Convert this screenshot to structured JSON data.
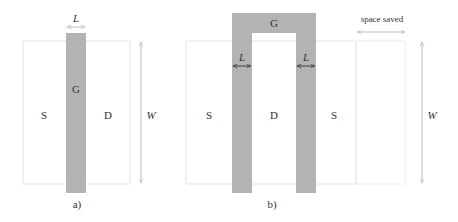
{
  "colors": {
    "gate": "#b3b3b3",
    "outline": "#e2e2e2",
    "arrow_light": "#bdbdbd",
    "arrow_dark": "#444444",
    "text": "#333333"
  },
  "panel_a": {
    "caption": "a)",
    "source_label": "S",
    "drain_label": "D",
    "gate_label": "G",
    "length_label": "L",
    "width_label": "W"
  },
  "panel_b": {
    "caption": "b)",
    "source_left_label": "S",
    "drain_label": "D",
    "source_right_label": "S",
    "gate_label": "G",
    "length_left_label": "L",
    "length_right_label": "L",
    "width_label": "W",
    "space_saved_label": "space saved"
  }
}
